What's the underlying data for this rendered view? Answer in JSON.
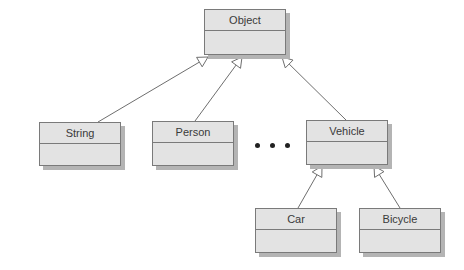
{
  "diagram": {
    "type": "uml-class-inheritance",
    "classes": [
      {
        "id": "object",
        "name": "Object",
        "box": {
          "x": 204,
          "y": 9,
          "w": 82,
          "h": 46
        }
      },
      {
        "id": "string",
        "name": "String",
        "box": {
          "x": 39,
          "y": 122,
          "w": 82,
          "h": 44
        }
      },
      {
        "id": "person",
        "name": "Person",
        "box": {
          "x": 152,
          "y": 121,
          "w": 82,
          "h": 45
        }
      },
      {
        "id": "vehicle",
        "name": "Vehicle",
        "box": {
          "x": 306,
          "y": 120,
          "w": 82,
          "h": 45
        }
      },
      {
        "id": "car",
        "name": "Car",
        "box": {
          "x": 255,
          "y": 208,
          "w": 82,
          "h": 45
        }
      },
      {
        "id": "bicycle",
        "name": "Bicycle",
        "box": {
          "x": 359,
          "y": 208,
          "w": 82,
          "h": 45
        }
      }
    ],
    "ellipsis": {
      "label": "• • •",
      "dots": [
        {
          "x": 257,
          "y": 145
        },
        {
          "x": 272,
          "y": 145
        },
        {
          "x": 287,
          "y": 145
        }
      ]
    },
    "generalizations": [
      {
        "from": "string",
        "to": "object",
        "start": [
          98,
          122
        ],
        "tip": [
          208,
          57
        ]
      },
      {
        "from": "person",
        "to": "object",
        "start": [
          195,
          121
        ],
        "tip": [
          242,
          57
        ]
      },
      {
        "from": "vehicle",
        "to": "object",
        "start": [
          346,
          120
        ],
        "tip": [
          282,
          57
        ]
      },
      {
        "from": "car",
        "to": "vehicle",
        "start": [
          298,
          208
        ],
        "tip": [
          322,
          166
        ]
      },
      {
        "from": "bicycle",
        "to": "vehicle",
        "start": [
          400,
          208
        ],
        "tip": [
          374,
          166
        ]
      }
    ],
    "colors": {
      "box_fill": "#e3e3e3",
      "box_border": "#7a7a7a",
      "box_shadow": "#b4b4b4",
      "text": "#3a3a3a",
      "edge": "#6e6e6e"
    }
  }
}
